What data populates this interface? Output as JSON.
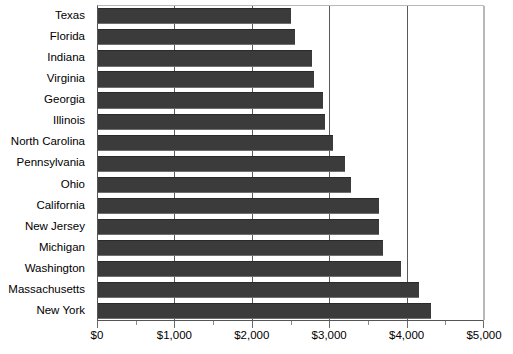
{
  "chart_data": {
    "type": "bar",
    "orientation": "horizontal",
    "title": "",
    "subtitle": "",
    "xlabel": "",
    "ylabel": "",
    "xlim": [
      0,
      5000
    ],
    "grid": true,
    "legend": false,
    "legend_position": "none",
    "bar_color": "#3b3b3b",
    "background_color": "#ffffff",
    "axis_color": "#555555",
    "gridline_color": "#5a5a5a",
    "x_tick_labels": [
      "$0",
      "$1,000",
      "$2,000",
      "$3,000",
      "$4,000",
      "$5,000"
    ],
    "x_tick_values": [
      0,
      1000,
      2000,
      3000,
      4000,
      5000
    ],
    "x_minor_tick_values": [
      500,
      1500,
      2500,
      3500,
      4500
    ],
    "categories": [
      "Texas",
      "Florida",
      "Indiana",
      "Virginia",
      "Georgia",
      "Illinois",
      "North Carolina",
      "Pennsylvania",
      "Ohio",
      "California",
      "New Jersey",
      "Michigan",
      "Washington",
      "Massachusetts",
      "New York"
    ],
    "values": [
      2490,
      2540,
      2760,
      2790,
      2910,
      2930,
      3040,
      3190,
      3270,
      3630,
      3630,
      3680,
      3910,
      4150,
      4300
    ]
  }
}
